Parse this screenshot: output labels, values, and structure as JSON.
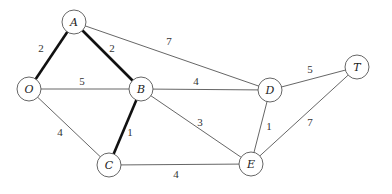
{
  "graph": {
    "node_radius": 12,
    "nodes": [
      {
        "id": "A",
        "label": "A",
        "x": 74,
        "y": 22
      },
      {
        "id": "O",
        "label": "O",
        "x": 29,
        "y": 89
      },
      {
        "id": "B",
        "label": "B",
        "x": 141,
        "y": 89
      },
      {
        "id": "C",
        "label": "C",
        "x": 109,
        "y": 165
      },
      {
        "id": "D",
        "label": "D",
        "x": 270,
        "y": 90
      },
      {
        "id": "E",
        "label": "E",
        "x": 251,
        "y": 164
      },
      {
        "id": "T",
        "label": "T",
        "x": 357,
        "y": 67
      }
    ],
    "edges": [
      {
        "from": "O",
        "to": "A",
        "weight": "2",
        "bold": true,
        "lx": 41,
        "ly": 52
      },
      {
        "from": "A",
        "to": "B",
        "weight": "2",
        "bold": true,
        "lx": 112,
        "ly": 52
      },
      {
        "from": "A",
        "to": "D",
        "weight": "7",
        "bold": false,
        "lx": 169,
        "ly": 45
      },
      {
        "from": "O",
        "to": "B",
        "weight": "5",
        "bold": false,
        "lx": 82,
        "ly": 85
      },
      {
        "from": "B",
        "to": "D",
        "weight": "4",
        "bold": false,
        "lx": 196,
        "ly": 85
      },
      {
        "from": "D",
        "to": "T",
        "weight": "5",
        "bold": false,
        "lx": 310,
        "ly": 73
      },
      {
        "from": "O",
        "to": "C",
        "weight": "4",
        "bold": false,
        "lx": 60,
        "ly": 136
      },
      {
        "from": "B",
        "to": "C",
        "weight": "1",
        "bold": true,
        "lx": 130,
        "ly": 136
      },
      {
        "from": "B",
        "to": "E",
        "weight": "3",
        "bold": false,
        "lx": 200,
        "ly": 126
      },
      {
        "from": "D",
        "to": "E",
        "weight": "1",
        "bold": false,
        "lx": 269,
        "ly": 130
      },
      {
        "from": "T",
        "to": "E",
        "weight": "7",
        "bold": false,
        "lx": 310,
        "ly": 126
      },
      {
        "from": "C",
        "to": "E",
        "weight": "4",
        "bold": false,
        "lx": 176,
        "ly": 178
      }
    ]
  }
}
